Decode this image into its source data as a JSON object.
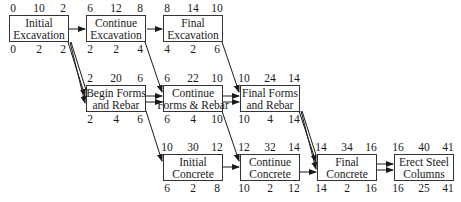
{
  "diagram": {
    "type": "activity-on-node network",
    "legend_layout": "top: ES, Duration(?), EF / bottom: LS, Float/Duration, LF",
    "nodes": [
      {
        "id": "initial-excavation",
        "line1": "Initial",
        "line2": "Excavation",
        "top": [
          "0",
          "10",
          "2"
        ],
        "bottom": [
          "0",
          "2",
          "2"
        ]
      },
      {
        "id": "continue-excavation",
        "line1": "Continue",
        "line2": "Excavation",
        "top": [
          "6",
          "12",
          "8"
        ],
        "bottom": [
          "2",
          "2",
          "4"
        ]
      },
      {
        "id": "final-excavation",
        "line1": "Final",
        "line2": "Excavation",
        "top": [
          "8",
          "14",
          "10"
        ],
        "bottom": [
          "4",
          "2",
          "6"
        ]
      },
      {
        "id": "begin-forms-and-rebar",
        "line1": "Begin Forms",
        "line2": "and Rebar",
        "top": [
          "2",
          "20",
          "6"
        ],
        "bottom": [
          "2",
          "4",
          "6"
        ]
      },
      {
        "id": "continue-forms-and-rebar",
        "line1": "Continue",
        "line2": "Forms & Rebar",
        "top": [
          "6",
          "22",
          "10"
        ],
        "bottom": [
          "6",
          "4",
          "10"
        ]
      },
      {
        "id": "final-forms-and-rebar",
        "line1": "Final Forms",
        "line2": "and Rebar",
        "top": [
          "10",
          "24",
          "14"
        ],
        "bottom": [
          "10",
          "4",
          "14"
        ]
      },
      {
        "id": "initial-concrete",
        "line1": "Initial",
        "line2": "Concrete",
        "top": [
          "10",
          "30",
          "12"
        ],
        "bottom": [
          "6",
          "2",
          "8"
        ]
      },
      {
        "id": "continue-concrete",
        "line1": "Continue",
        "line2": "Concrete",
        "top": [
          "12",
          "32",
          "14"
        ],
        "bottom": [
          "10",
          "2",
          "12"
        ]
      },
      {
        "id": "final-concrete",
        "line1": "Final",
        "line2": "Concrete",
        "top": [
          "14",
          "34",
          "16"
        ],
        "bottom": [
          "14",
          "2",
          "16"
        ]
      },
      {
        "id": "erect-steel-columns",
        "line1": "Erect Steel",
        "line2": "Columns",
        "top": [
          "16",
          "40",
          "41"
        ],
        "bottom": [
          "16",
          "25",
          "41"
        ]
      }
    ],
    "edges": [
      {
        "from": "initial-excavation",
        "to": "continue-excavation",
        "style": "single"
      },
      {
        "from": "continue-excavation",
        "to": "final-excavation",
        "style": "single"
      },
      {
        "from": "initial-excavation",
        "to": "begin-forms-and-rebar",
        "style": "double"
      },
      {
        "from": "continue-excavation",
        "to": "continue-forms-and-rebar",
        "style": "single"
      },
      {
        "from": "final-excavation",
        "to": "final-forms-and-rebar",
        "style": "single"
      },
      {
        "from": "begin-forms-and-rebar",
        "to": "continue-forms-and-rebar",
        "style": "double"
      },
      {
        "from": "continue-forms-and-rebar",
        "to": "final-forms-and-rebar",
        "style": "double"
      },
      {
        "from": "begin-forms-and-rebar",
        "to": "initial-concrete",
        "style": "single"
      },
      {
        "from": "continue-forms-and-rebar",
        "to": "continue-concrete",
        "style": "single"
      },
      {
        "from": "initial-concrete",
        "to": "continue-concrete",
        "style": "single"
      },
      {
        "from": "final-forms-and-rebar",
        "to": "final-concrete",
        "style": "double"
      },
      {
        "from": "continue-concrete",
        "to": "final-concrete",
        "style": "single"
      },
      {
        "from": "final-concrete",
        "to": "erect-steel-columns",
        "style": "double"
      }
    ]
  }
}
